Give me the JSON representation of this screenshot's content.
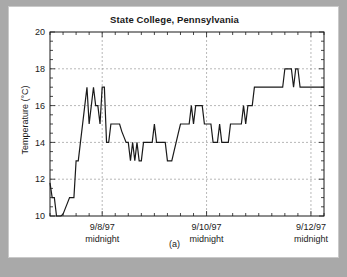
{
  "figure": {
    "caption": "(a)",
    "background_color": "#a9a9a9",
    "panel_color": "#ffffff"
  },
  "chart_data": {
    "type": "line",
    "title": "State College, Pennsylvania",
    "xlabel": "",
    "ylabel": "Temperature (°C)",
    "ylim": [
      10,
      20
    ],
    "yticks": [
      10,
      12,
      14,
      16,
      18,
      20
    ],
    "ytick_labels": [
      "10",
      "12",
      "14",
      "16",
      "18",
      "20"
    ],
    "xlim": [
      0,
      126
    ],
    "xtick_labels": [
      "9/8/97\nmidnight",
      "9/10/97\nmidnight",
      "9/12/97\nmidnight"
    ],
    "xtick_positions": [
      24,
      72,
      120
    ],
    "xtick_minor_interval_hours": 6,
    "xtick_label_lines": [
      [
        "9/8/97",
        "midnight"
      ],
      [
        "9/10/97",
        "midnight"
      ],
      [
        "9/12/97",
        "midnight"
      ]
    ],
    "grid": true,
    "grid_style": "dashed",
    "grid_color": "#9a9a9a",
    "legend": null,
    "line_color": "#1a1a1a",
    "line_width": 1.2,
    "x_unit": "hours since 9/7/97 midnight",
    "series": [
      {
        "name": "Temperature",
        "x": [
          0,
          1,
          2,
          3,
          4,
          5,
          6,
          7,
          8,
          9,
          10,
          11,
          12,
          13,
          14,
          15,
          16,
          17,
          18,
          19,
          20,
          21,
          22,
          23,
          24,
          25,
          26,
          27,
          28,
          29,
          30,
          31,
          32,
          33,
          34,
          35,
          36,
          37,
          38,
          39,
          40,
          41,
          42,
          43,
          44,
          45,
          46,
          47,
          48,
          49,
          50,
          51,
          52,
          53,
          54,
          55,
          56,
          57,
          58,
          59,
          60,
          61,
          62,
          63,
          64,
          65,
          66,
          67,
          68,
          69,
          70,
          71,
          72,
          73,
          74,
          75,
          76,
          77,
          78,
          79,
          80,
          81,
          82,
          83,
          84,
          85,
          86,
          87,
          88,
          89,
          90,
          91,
          92,
          93,
          94,
          95,
          96,
          97,
          98,
          99,
          100,
          101,
          102,
          103,
          104,
          105,
          106,
          107,
          108,
          109,
          110,
          111,
          112,
          113,
          114,
          115,
          116,
          117,
          118,
          119,
          120,
          121,
          122,
          123,
          124,
          125,
          126
        ],
        "values": [
          11.8,
          11.0,
          11.0,
          10.0,
          10.0,
          10.0,
          10.1,
          10.4,
          10.7,
          11.0,
          11.0,
          11.0,
          13.0,
          13.0,
          14.0,
          15.0,
          16.0,
          17.0,
          15.0,
          16.0,
          17.0,
          16.0,
          16.0,
          15.0,
          17.0,
          17.0,
          14.0,
          14.0,
          15.0,
          15.0,
          15.0,
          15.0,
          15.0,
          14.6,
          14.3,
          14.0,
          14.0,
          13.0,
          14.0,
          13.0,
          14.0,
          13.0,
          13.0,
          14.0,
          14.0,
          14.0,
          14.0,
          14.0,
          15.0,
          14.0,
          14.0,
          14.0,
          14.0,
          14.0,
          13.0,
          13.0,
          13.0,
          13.5,
          14.0,
          14.5,
          15.0,
          15.0,
          15.0,
          15.0,
          15.0,
          16.0,
          15.0,
          16.0,
          16.0,
          16.0,
          16.0,
          15.0,
          15.0,
          15.0,
          15.0,
          14.0,
          14.0,
          14.0,
          15.0,
          14.0,
          14.0,
          14.0,
          14.0,
          15.0,
          15.0,
          15.0,
          15.0,
          15.0,
          15.0,
          16.0,
          15.0,
          16.0,
          16.0,
          16.0,
          17.0,
          17.0,
          17.0,
          17.0,
          17.0,
          17.0,
          17.0,
          17.0,
          17.0,
          17.0,
          17.0,
          17.0,
          17.0,
          17.0,
          18.0,
          18.0,
          18.0,
          18.0,
          17.0,
          18.0,
          18.0,
          17.0,
          17.0,
          17.0,
          17.0,
          17.0,
          17.0,
          17.0,
          17.0,
          17.0,
          17.0,
          17.0,
          17.0
        ]
      }
    ]
  }
}
